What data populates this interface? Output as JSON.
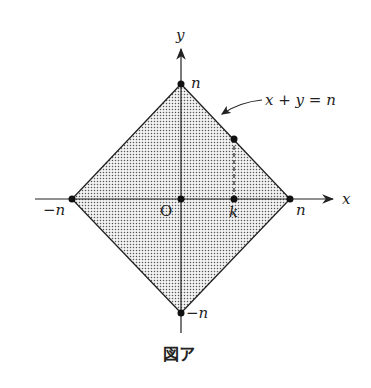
{
  "figure": {
    "caption": "図ア",
    "axis_labels": {
      "x": "x",
      "y": "y"
    },
    "origin_label": "O",
    "vertex_labels": {
      "top": "n",
      "right": "n",
      "left": "−n",
      "bottom": "−n"
    },
    "point_label_k": "k",
    "line_label": "x + y = n",
    "region": "|x| + |y| ≤ n (shaded square)",
    "colors": {
      "stroke": "#222222",
      "dots": "#555555",
      "fill": "#e6e6e6"
    }
  }
}
